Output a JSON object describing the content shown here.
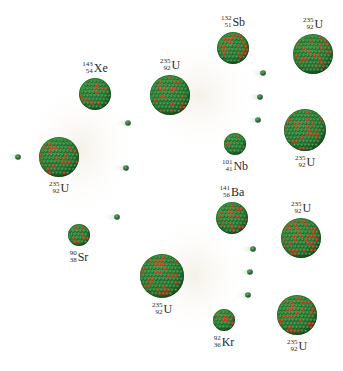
{
  "colors": {
    "background": "#ffffff",
    "neutron": "#2f8a3e",
    "neutron_dark": "#14451c",
    "proton": "#c8321e",
    "nucleus_base": "#2e8b35",
    "nucleus_shadow": "#15501a",
    "trail": "#cfe7d2",
    "label": "#2a2a2a"
  },
  "neutrons": [
    {
      "id": "incoming-neutron",
      "stage": 0
    },
    {
      "id": "neutron-gen1-a",
      "stage": 1
    },
    {
      "id": "neutron-gen1-b",
      "stage": 1
    },
    {
      "id": "neutron-gen1-c",
      "stage": 1
    },
    {
      "id": "neutron-gen2-top-a",
      "stage": 2
    },
    {
      "id": "neutron-gen2-top-b",
      "stage": 2
    },
    {
      "id": "neutron-gen2-top-c",
      "stage": 2
    },
    {
      "id": "neutron-gen2-bottom-a",
      "stage": 2
    },
    {
      "id": "neutron-gen2-bottom-b",
      "stage": 2
    },
    {
      "id": "neutron-gen2-bottom-c",
      "stage": 2
    }
  ],
  "nuclei": [
    {
      "id": "u235-initial",
      "element": "U",
      "mass": "235",
      "atomic": "92",
      "role": "target",
      "label_side": "below"
    },
    {
      "id": "xe143",
      "element": "Xe",
      "mass": "143",
      "atomic": "54",
      "role": "fragment",
      "label_side": "above"
    },
    {
      "id": "sr90",
      "element": "Sr",
      "mass": "90",
      "atomic": "38",
      "role": "fragment",
      "label_side": "below"
    },
    {
      "id": "u235-mid-top",
      "element": "U",
      "mass": "235",
      "atomic": "92",
      "role": "target",
      "label_side": "above"
    },
    {
      "id": "u235-mid-bottom",
      "element": "U",
      "mass": "235",
      "atomic": "92",
      "role": "target",
      "label_side": "below"
    },
    {
      "id": "sb132",
      "element": "Sb",
      "mass": "132",
      "atomic": "51",
      "role": "fragment",
      "label_side": "above"
    },
    {
      "id": "nb101",
      "element": "Nb",
      "mass": "101",
      "atomic": "41",
      "role": "fragment",
      "label_side": "below"
    },
    {
      "id": "ba141",
      "element": "Ba",
      "mass": "141",
      "atomic": "56",
      "role": "fragment",
      "label_side": "above"
    },
    {
      "id": "kr92",
      "element": "Kr",
      "mass": "92",
      "atomic": "36",
      "role": "fragment",
      "label_side": "below"
    },
    {
      "id": "u235-right-1",
      "element": "U",
      "mass": "235",
      "atomic": "92",
      "role": "target",
      "label_side": "above"
    },
    {
      "id": "u235-right-2",
      "element": "U",
      "mass": "235",
      "atomic": "92",
      "role": "target",
      "label_side": "below"
    },
    {
      "id": "u235-right-3",
      "element": "U",
      "mass": "235",
      "atomic": "92",
      "role": "target",
      "label_side": "above"
    },
    {
      "id": "u235-right-4",
      "element": "U",
      "mass": "235",
      "atomic": "92",
      "role": "target",
      "label_side": "below"
    }
  ]
}
